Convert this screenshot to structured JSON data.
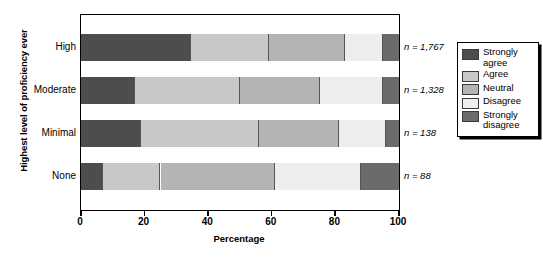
{
  "chart_data": {
    "type": "bar",
    "orientation": "horizontal",
    "stacked": true,
    "normalized_percent": true,
    "title": "",
    "subtitle": "",
    "xlabel": "Percentage",
    "ylabel": "Highest level of proficiency ever",
    "xlim": [
      0,
      100
    ],
    "xticks": [
      0,
      20,
      40,
      60,
      80,
      100
    ],
    "xticklabels": [
      "0",
      "20",
      "40",
      "60",
      "80",
      "100"
    ],
    "grid": false,
    "legend_position": "right",
    "categories": [
      "High",
      "Moderate",
      "Minimal",
      "None"
    ],
    "category_annotations": [
      "n = 1,767",
      "n = 1,328",
      "n = 138",
      "n = 88"
    ],
    "series": [
      {
        "name": "Strongly agree",
        "color": "#4d4d4d",
        "values": [
          34.5,
          17.0,
          19.0,
          7.0
        ]
      },
      {
        "name": "Agree",
        "color": "#c8c8c8",
        "values": [
          24.5,
          33.0,
          37.0,
          18.0
        ]
      },
      {
        "name": "Neutral",
        "color": "#b4b4b4",
        "values": [
          24.0,
          25.0,
          25.0,
          36.0
        ]
      },
      {
        "name": "Disagree",
        "color": "#eeeeee",
        "values": [
          12.0,
          20.0,
          15.0,
          27.0
        ]
      },
      {
        "name": "Strongly disagree",
        "color": "#6b6b6b",
        "values": [
          5.0,
          5.0,
          4.0,
          12.0
        ]
      }
    ],
    "legend_entries": [
      "Strongly\nagree",
      "Agree",
      "Neutral",
      "Disagree",
      "Strongly\ndisagree"
    ]
  }
}
